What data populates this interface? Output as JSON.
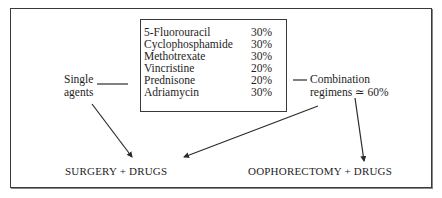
{
  "drug_box": {
    "rows": [
      {
        "name": "5-Fluorouracil",
        "percent": "30%"
      },
      {
        "name": "Cyclophosphamide",
        "percent": "30%"
      },
      {
        "name": "Methotrexate",
        "percent": "30%"
      },
      {
        "name": "Vincristine",
        "percent": "20%"
      },
      {
        "name": "Prednisone",
        "percent": "20%"
      },
      {
        "name": "Adriamycin",
        "percent": "30%"
      }
    ]
  },
  "left_label": {
    "line1": "Single",
    "line2": "agents"
  },
  "right_label": {
    "line1": "Combination",
    "line2": "regimens ≃ 60%"
  },
  "outcomes": {
    "left": "SURGERY + DRUGS",
    "right": "OOPHORECTOMY + DRUGS"
  },
  "colors": {
    "line": "#2a2a2a",
    "text": "#1e1e1e",
    "background": "#ffffff"
  }
}
